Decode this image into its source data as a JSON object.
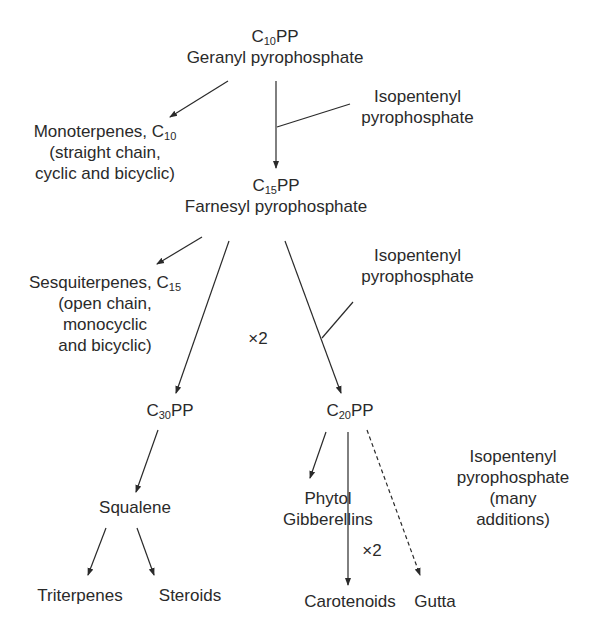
{
  "nodes": {
    "c10pp": {
      "prefix": "C",
      "sub": "10",
      "suffix": "PP",
      "name": "Geranyl pyrophosphate"
    },
    "monoterpenes": {
      "title": "Monoterpenes, C",
      "sub": "10",
      "line2": "(straight chain,",
      "line3": "cyclic and bicyclic)"
    },
    "ipp1": {
      "line1": "Isopentenyl",
      "line2": "pyrophosphate"
    },
    "c15pp": {
      "prefix": "C",
      "sub": "15",
      "suffix": "PP",
      "name": "Farnesyl pyrophosphate"
    },
    "sesquiterpenes": {
      "title": "Sesquiterpenes, C",
      "sub": "15",
      "line2": "(open chain,",
      "line3": "monocyclic",
      "line4": "and bicyclic)"
    },
    "ipp2": {
      "line1": "Isopentenyl",
      "line2": "pyrophosphate"
    },
    "times2_a": "×2",
    "c30pp": {
      "prefix": "C",
      "sub": "30",
      "suffix": "PP"
    },
    "c20pp": {
      "prefix": "C",
      "sub": "20",
      "suffix": "PP"
    },
    "squalene": "Squalene",
    "triterpenes": "Triterpenes",
    "steroids": "Steroids",
    "phytol": {
      "line1": "Phytol",
      "line2": "Gibberellins"
    },
    "times2_b": "×2",
    "ipp3": {
      "line1": "Isopentenyl",
      "line2": "pyrophosphate",
      "line3": "(many",
      "line4": "additions)"
    },
    "carotenoids": "Carotenoids",
    "gutta": "Gutta"
  },
  "colors": {
    "line": "#2a2a2a",
    "text": "#2a2a2a",
    "background": "#ffffff"
  }
}
